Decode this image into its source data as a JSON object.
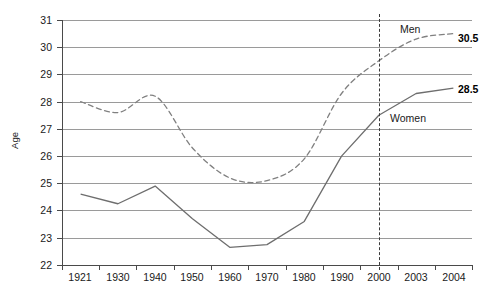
{
  "chart_data": {
    "type": "line",
    "title": "",
    "xlabel": "",
    "ylabel": "Age",
    "categories": [
      "1921",
      "1930",
      "1940",
      "1950",
      "1960",
      "1970",
      "1980",
      "1990",
      "2000",
      "2003",
      "2004"
    ],
    "ylim": [
      22,
      31
    ],
    "yticks": [
      "22",
      "23",
      "24",
      "25",
      "26",
      "27",
      "28",
      "29",
      "30",
      "31"
    ],
    "grid": "horizontal",
    "legend": "inline-labels",
    "series": [
      {
        "name": "Men",
        "style": "dashed",
        "color": "#808080",
        "values": [
          28.0,
          27.6,
          28.2,
          26.3,
          25.2,
          25.1,
          25.9,
          28.3,
          29.5,
          30.3,
          30.5
        ],
        "end_label": "30.5",
        "label_text": "Men"
      },
      {
        "name": "Women",
        "style": "solid",
        "color": "#6e6e6e",
        "values": [
          24.6,
          24.25,
          24.9,
          23.7,
          22.65,
          22.75,
          23.6,
          26.0,
          27.5,
          28.3,
          28.5
        ],
        "end_label": "28.5",
        "label_text": "Women"
      }
    ],
    "annotations": [
      {
        "name": "reference-line-2000",
        "x": "2000",
        "style": "dashed-vertical"
      }
    ]
  },
  "labels": {
    "men_series": "Men",
    "women_series": "Women",
    "men_end_value": "30.5",
    "women_end_value": "28.5",
    "y_axis_title": "Age"
  }
}
